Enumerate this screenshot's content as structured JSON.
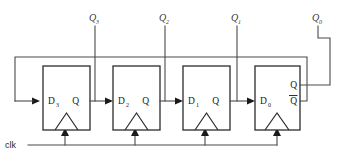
{
  "diagram": {
    "clock_label": "clk",
    "colors": {
      "background": "#ffffff",
      "wire": "#4a4a4a",
      "box_stroke": "#2b2b2b",
      "text": "#1a1a1a"
    },
    "flipflops": [
      {
        "id": "ff3",
        "d_label": "D",
        "d_sub": "3",
        "q_label": "Q",
        "qbar_label": "",
        "output_tap": "Q3"
      },
      {
        "id": "ff2",
        "d_label": "D",
        "d_sub": "2",
        "q_label": "Q",
        "qbar_label": "",
        "output_tap": "Q2"
      },
      {
        "id": "ff1",
        "d_label": "D",
        "d_sub": "1",
        "q_label": "Q",
        "qbar_label": "",
        "output_tap": "Q1"
      },
      {
        "id": "ff0",
        "d_label": "D",
        "d_sub": "0",
        "q_label": "Q",
        "qbar_label": "Q",
        "output_tap": "Q0"
      }
    ],
    "output_labels": [
      {
        "name": "Q3",
        "base": "Q",
        "sub": "3"
      },
      {
        "name": "Q2",
        "base": "Q",
        "sub": "2"
      },
      {
        "name": "Q1",
        "base": "Q",
        "sub": "1"
      },
      {
        "name": "Q0",
        "base": "Q",
        "sub": "0"
      }
    ],
    "icons": {
      "clock_triangle": "dynamic-input-triangle-icon",
      "signal_arrow": "signal-arrow-icon",
      "overbar": "complement-overbar-icon"
    }
  }
}
